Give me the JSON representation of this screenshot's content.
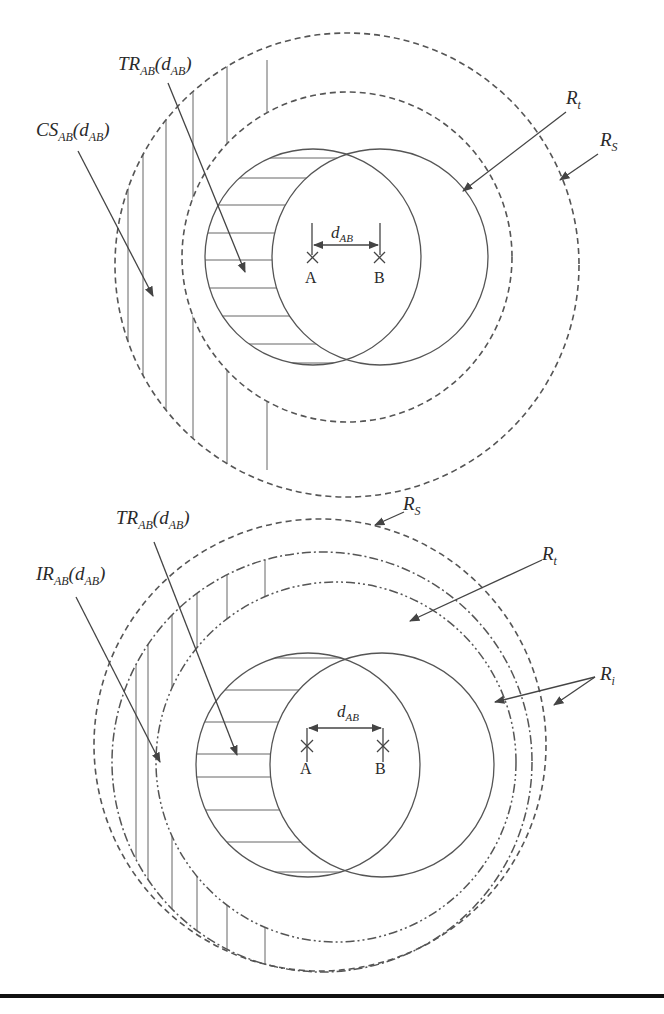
{
  "figures": [
    {
      "id": "top",
      "labels": {
        "tr": "TR",
        "tr_sub": "AB",
        "tr_arg": "d",
        "tr_arg_sub": "AB",
        "cs": "CS",
        "cs_sub": "AB",
        "cs_arg": "d",
        "cs_arg_sub": "AB",
        "rt": "R",
        "rt_sub": "t",
        "rs": "R",
        "rs_sub": "S",
        "d": "d",
        "d_sub": "AB",
        "a": "A",
        "b": "B"
      }
    },
    {
      "id": "bottom",
      "labels": {
        "tr": "TR",
        "tr_sub": "AB",
        "tr_arg": "d",
        "tr_arg_sub": "AB",
        "ir": "IR",
        "ir_sub": "AB",
        "ir_arg": "d",
        "ir_arg_sub": "AB",
        "rt": "R",
        "rt_sub": "t",
        "rs": "R",
        "rs_sub": "S",
        "ri": "R",
        "ri_sub": "i",
        "d": "d",
        "d_sub": "AB",
        "a": "A",
        "b": "B"
      }
    }
  ],
  "colors": {
    "line": "#555555",
    "text": "#2a2a2a",
    "rule": "#111111"
  }
}
